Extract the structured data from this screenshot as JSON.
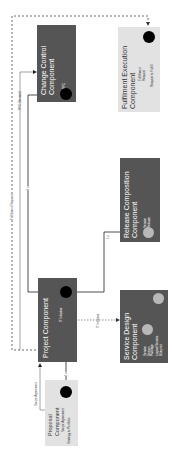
{
  "diagram": {
    "orientation": "rotated -90deg",
    "components": [
      {
        "id": "change_control",
        "title_line1": "Change Control",
        "title_line2": "Component",
        "items": [
          "RFC"
        ],
        "style": "dark"
      },
      {
        "id": "fulfilment_execution",
        "title_line1": "Fulfilment Execution",
        "title_line2": "Component",
        "items": [
          "Fulfillment",
          "Request",
          "Request to Fulfill"
        ],
        "style": "light"
      },
      {
        "id": "release_composition",
        "title_line1": "Release  Composition",
        "title_line2": "Component",
        "items": [
          "Service",
          "Release"
        ],
        "style": "dark"
      },
      {
        "id": "project",
        "title_line1": "Project Component",
        "items": [
          "IT Initiative"
        ],
        "style": "dark"
      },
      {
        "id": "service_design",
        "title_line1": "Service Design",
        "title_line2": "Component",
        "items": [
          "Service",
          "Design",
          "Package",
          "Logical Service",
          "Blueprint"
        ],
        "style": "dark"
      },
      {
        "id": "proposal",
        "title_line1": "Proposal",
        "title_line2": "Component",
        "items": [
          "Scope Agreement",
          "Strategy to Portfolio"
        ],
        "style": "light"
      }
    ],
    "edges": [
      {
        "label": "RFC (Normal)",
        "from": "project",
        "to": "change_control",
        "style": "solid"
      },
      {
        "label": "Fulfillment Request",
        "from": "project",
        "to": "fulfilment_execution",
        "style": "dashed"
      },
      {
        "label": "1:n",
        "from": "change_control",
        "to": "project",
        "style": "solid"
      },
      {
        "label": "1:n",
        "from": "project",
        "to": "release_composition",
        "style": "solid"
      },
      {
        "label": "IT Initiative",
        "from": "project",
        "to": "service_design",
        "style": "dashed"
      },
      {
        "label": "Scope Agreement",
        "from": "proposal",
        "to": "project",
        "style": "solid"
      },
      {
        "label": "1:n",
        "from": "proposal",
        "to": "project",
        "style": "solid"
      },
      {
        "label": "1:n",
        "from": "service_design_package",
        "to": "logical_service_blueprint",
        "style": "solid"
      }
    ],
    "colors": {
      "dark_box": "#555555",
      "light_box": "#e2e2e2",
      "data_object_black": "#000000",
      "data_object_gray": "#b8b8b8",
      "line": "#222222"
    }
  }
}
